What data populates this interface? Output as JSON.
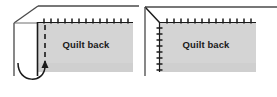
{
  "figure": {
    "name": "quilt-binding-mitered-corner-diagram",
    "panel_count": 2,
    "background_color": "#ffffff",
    "quilt_fill_color": "#d4d4d4",
    "line_color": "#1a1a1a",
    "fold_line_color": "#6e6e6e"
  },
  "panels": [
    {
      "id": "left",
      "label": "Quilt back",
      "label_x": 86,
      "label_y": 48,
      "quilt": {
        "x": 37,
        "y": 22,
        "width": 96,
        "height": 50
      },
      "stitch_line": {
        "orientation": "horizontal",
        "x_start": 40,
        "x_end": 133,
        "y": 22,
        "tick_count": 14,
        "tick_length": 5
      },
      "fold_edge": {
        "corner_x": 14,
        "corner_y": 23,
        "diagonal_to_x": 38,
        "diagonal_to_y": 6,
        "top_edge_to_x": 139,
        "vertical_to_y": 76
      },
      "dashed_line": {
        "x": 45,
        "y_start": 24,
        "y_end": 72,
        "dash": "4 4"
      },
      "arrow": {
        "type": "curved-up-arrow",
        "from_x": 18,
        "from_y": 62,
        "to_x": 45,
        "to_y": 62,
        "head_direction": "up"
      }
    },
    {
      "id": "right",
      "label": "Quilt back",
      "label_x": 63,
      "label_y": 48,
      "quilt": {
        "x": 20,
        "y": 22,
        "width": 97,
        "height": 50
      },
      "stitch_line_top": {
        "orientation": "horizontal",
        "x_start": 22,
        "x_end": 117,
        "y": 22,
        "tick_count": 14,
        "tick_length": 5
      },
      "stitch_line_side": {
        "orientation": "vertical",
        "x": 20,
        "y_start": 24,
        "y_end": 72,
        "tick_count": 8,
        "tick_length": 5
      },
      "fold_edge": {
        "corner_x": 6,
        "corner_y": 7,
        "diagonal_to_x": 21,
        "diagonal_to_y": 23,
        "top_edge_to_x": 138,
        "vertical_to_y": 76
      }
    }
  ],
  "icons": {
    "curved_arrow": "curved-arrow-icon",
    "stitch_tick": "stitch-tick-icon",
    "fold_diagonal": "fold-diagonal-icon"
  }
}
